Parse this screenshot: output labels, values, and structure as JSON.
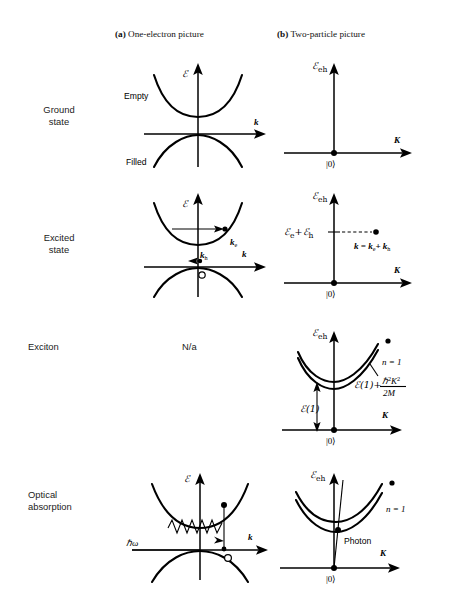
{
  "figure": {
    "type": "diagram",
    "columns": [
      {
        "tag": "(a)",
        "title": "One-electron picture"
      },
      {
        "tag": "(b)",
        "title": "Two-particle picture"
      }
    ],
    "rows": [
      {
        "label": "Ground\nstate"
      },
      {
        "label": "Excited\nstate"
      },
      {
        "label": "Exciton"
      },
      {
        "label": "Optical\nabsorption"
      }
    ]
  },
  "cells": {
    "a_ground": {
      "y_axis": "ℰ",
      "x_axis": "k",
      "band_upper_label": "Empty",
      "band_lower_label": "Filled"
    },
    "b_ground": {
      "y_axis": "ℰ",
      "y_axis_sub": "eh",
      "x_axis": "K",
      "origin_label": "|0⟩"
    },
    "a_excited": {
      "y_axis": "ℰ",
      "x_axis": "k",
      "electron_label": "k",
      "electron_sub": "e",
      "hole_label": "k",
      "hole_sub": "h",
      "hole_marker": "o"
    },
    "b_excited": {
      "y_axis": "ℰ",
      "y_axis_sub": "eh",
      "x_axis": "K",
      "level_label_1": "ℰ",
      "level_sub_1": "e",
      "level_plus": "+",
      "level_label_2": "ℰ",
      "level_sub_2": "h",
      "momentum_label": "k = k",
      "momentum_sub_1": "e",
      "momentum_plus": "+ k",
      "momentum_sub_2": "h",
      "origin_label": "|0⟩"
    },
    "a_exciton": {
      "na": "N/a"
    },
    "b_exciton": {
      "y_axis": "ℰ",
      "y_axis_sub": "eh",
      "x_axis": "K",
      "band_label": "n = 1",
      "binding_label": "ℰ(1)",
      "dispersion_label": "ℰ(1)+",
      "dispersion_numerator": "ℏ",
      "dispersion_num_exp1": "2",
      "dispersion_num_k": "K",
      "dispersion_num_exp2": "2",
      "dispersion_denominator": "2M",
      "origin_label": "|0⟩"
    },
    "a_optical": {
      "y_axis": "ℰ",
      "x_axis": "k",
      "photon_label": "ℏω",
      "hole_marker": "o"
    },
    "b_optical": {
      "y_axis": "ℰ",
      "y_axis_sub": "eh",
      "x_axis": "K",
      "band_label": "n = 1",
      "photon_label": "Photon",
      "origin_label": "|0⟩"
    }
  }
}
